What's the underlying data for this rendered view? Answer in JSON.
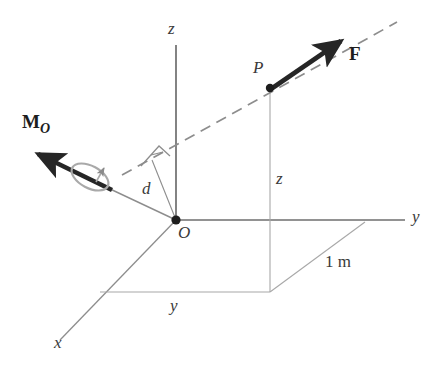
{
  "figure": {
    "type": "free-body-moment-diagram",
    "background_color": "#ffffff",
    "line_color": "#6e6e6e",
    "bold_vector_color": "#262626",
    "label_color": "#3a3a3a"
  },
  "axes": {
    "z_label": "z",
    "y_label": "y",
    "x_label": "x",
    "origin_label": "O"
  },
  "points": {
    "origin_label": "O",
    "p_label": "P"
  },
  "vectors": {
    "force_label": "F",
    "moment_label": "M",
    "moment_subscript": "O"
  },
  "dimensions": {
    "perp_distance_label": "d",
    "height_label": "z",
    "horizontal_label": "y",
    "unit_length_label": "1 m"
  },
  "geometry": {
    "origin": [
      176,
      220
    ],
    "point_p": [
      270,
      88
    ],
    "z_axis_top": [
      176,
      45
    ],
    "y_axis_end": [
      405,
      220
    ],
    "x_axis_end": [
      60,
      340
    ],
    "force_arrow_tip": [
      345,
      38
    ],
    "dashed_line_start": [
      122,
      175
    ],
    "dashed_line_end": [
      397,
      22
    ],
    "moment_arrow_tip": [
      33,
      152
    ],
    "perp_foot": [
      152,
      160
    ],
    "one_meter_corner": [
      365,
      222
    ],
    "base_corner": [
      270,
      292
    ],
    "base_left": [
      100,
      292
    ]
  }
}
